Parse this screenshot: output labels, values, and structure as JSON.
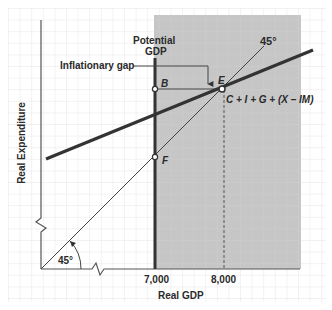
{
  "diagram": {
    "x_axis_label": "Real GDP",
    "y_axis_label": "Real Expenditure",
    "x_ticks": [
      "7,000",
      "8,000"
    ],
    "potential_gdp_label_line1": "Potential",
    "potential_gdp_label_line2": "GDP",
    "inflationary_gap_label": "Inflationary gap",
    "forty_five_top_label": "45°",
    "forty_five_angle_label": "45°",
    "expenditure_line_label": "C + I + G + (X – IM)",
    "points": {
      "B": "B",
      "E": "E",
      "F": "F"
    },
    "colors": {
      "shaded_region": "#c8c8c8",
      "grid": "#dcdcdc",
      "thick_line": "#333333",
      "thin_line": "#555555",
      "background": "#ffffff"
    }
  }
}
